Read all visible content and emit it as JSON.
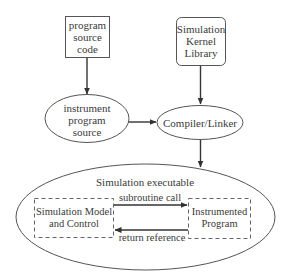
{
  "diagram": {
    "nodes": {
      "program_source": {
        "lines": [
          "program",
          "source",
          "code"
        ],
        "shape": "rectangle"
      },
      "instrument_source": {
        "lines": [
          "instrument",
          "program",
          "source"
        ],
        "shape": "ellipse"
      },
      "kernel_library": {
        "lines": [
          "Simulation",
          "Kernel",
          "Library"
        ],
        "shape": "rounded-rectangle"
      },
      "compiler_linker": {
        "label": "Compiler/Linker",
        "shape": "ellipse"
      },
      "executable": {
        "label": "Simulation executable",
        "shape": "ellipse"
      },
      "model_control": {
        "lines": [
          "Simulation Model",
          "and Control"
        ],
        "shape": "dashed-rectangle"
      },
      "instrumented_program": {
        "lines": [
          "Instrumented",
          "Program"
        ],
        "shape": "dashed-rectangle"
      }
    },
    "edges": {
      "subroutine_call": "subroutine call",
      "return_reference": "return reference"
    },
    "colors": {
      "stroke": "#555555",
      "arrow": "#333333",
      "text": "#3a3a3a",
      "background": "#ffffff"
    }
  }
}
